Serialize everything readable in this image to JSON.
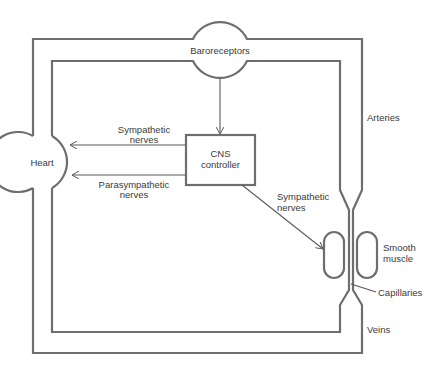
{
  "diagram": {
    "nodes": {
      "baroreceptors": "Baroreceptors",
      "heart": "Heart",
      "cns_line1": "CNS",
      "cns_line2": "controller",
      "smooth_muscle_line1": "Smooth",
      "smooth_muscle_line2": "muscle"
    },
    "vessels": {
      "arteries": "Arteries",
      "capillaries": "Capillaries",
      "veins": "Veins"
    },
    "edges": [
      {
        "from": "Baroreceptors",
        "to": "CNS controller",
        "label": ""
      },
      {
        "from": "CNS controller",
        "to": "Heart",
        "label_line1": "Sympathetic",
        "label_line2": "nerves"
      },
      {
        "from": "CNS controller",
        "to": "Heart",
        "label_line1": "Parasympathetic",
        "label_line2": "nerves"
      },
      {
        "from": "CNS controller",
        "to": "Smooth muscle",
        "label_line1": "Sympathetic",
        "label_line2": "nerves"
      }
    ],
    "colors": {
      "line": "#6e6e6e",
      "text": "#3a3a3a",
      "background": "#ffffff"
    }
  }
}
